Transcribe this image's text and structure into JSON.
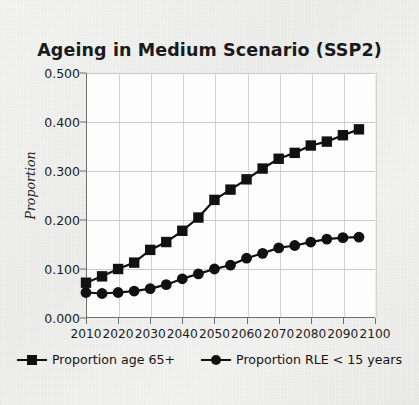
{
  "chart_data": {
    "type": "line",
    "title": "Ageing in Medium Scenario (SSP2)",
    "xlabel": "",
    "ylabel": "Proportion",
    "xlim": [
      2010,
      2100
    ],
    "ylim": [
      0.0,
      0.5
    ],
    "grid": true,
    "legend_position": "bottom",
    "x": [
      2010,
      2015,
      2020,
      2025,
      2030,
      2035,
      2040,
      2045,
      2050,
      2055,
      2060,
      2065,
      2070,
      2075,
      2080,
      2085,
      2090,
      2095
    ],
    "xtick_labels": [
      "2010",
      "2020",
      "2030",
      "2040",
      "2050",
      "2060",
      "2070",
      "2080",
      "2090",
      "2100"
    ],
    "xticks": [
      2010,
      2020,
      2030,
      2040,
      2050,
      2060,
      2070,
      2080,
      2090,
      2100
    ],
    "ytick_labels": [
      "0.000",
      "0.100",
      "0.200",
      "0.300",
      "0.400",
      "0.500"
    ],
    "yticks": [
      0.0,
      0.1,
      0.2,
      0.3,
      0.4,
      0.5
    ],
    "series": [
      {
        "name": "Proportion age 65+",
        "marker": "square",
        "color": "#111111",
        "values": [
          0.072,
          0.085,
          0.1,
          0.113,
          0.139,
          0.155,
          0.178,
          0.205,
          0.241,
          0.262,
          0.283,
          0.305,
          0.325,
          0.337,
          0.352,
          0.36,
          0.373,
          0.385
        ]
      },
      {
        "name": "Proportion RLE < 15 years",
        "marker": "circle",
        "color": "#111111",
        "values": [
          0.052,
          0.05,
          0.052,
          0.055,
          0.06,
          0.068,
          0.08,
          0.09,
          0.1,
          0.108,
          0.122,
          0.132,
          0.143,
          0.148,
          0.155,
          0.161,
          0.164,
          0.165
        ]
      }
    ]
  },
  "legend": {
    "items": [
      {
        "label": "Proportion age 65+",
        "marker": "square"
      },
      {
        "label": "Proportion RLE < 15 years",
        "marker": "circle"
      }
    ]
  },
  "colors": {
    "series": "#111111",
    "axis": "#6f6f6f",
    "grid": "#c9c9c9",
    "plot_background": "#fdfdfd",
    "page_background": "#f2f2f0",
    "text": "#1c1c1c"
  }
}
